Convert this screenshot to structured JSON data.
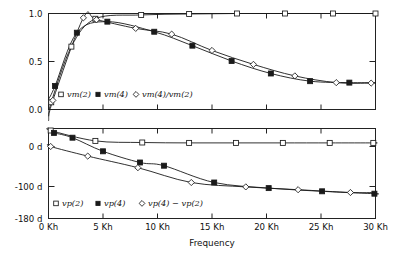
{
  "figure": {
    "xlabel": "Frequency",
    "background": "#ffffff",
    "line_color": "#1a1a1a"
  },
  "chart_data": [
    {
      "type": "line",
      "panel": "top",
      "title": "",
      "xlabel": "Frequency",
      "ylabel": "",
      "xlim": [
        0,
        30
      ],
      "ylim": [
        0.0,
        1.0
      ],
      "xticks": [
        0,
        5,
        10,
        15,
        20,
        25,
        30
      ],
      "xticklabels": [
        "0 Kh",
        "5 Kh",
        "10 Kh",
        "15 Kh",
        "20 Kh",
        "25 Kh",
        "30 Kh"
      ],
      "yticks": [
        0.0,
        0.5,
        1.0
      ],
      "yticklabels": [
        "0.0",
        "0.5",
        "1.0"
      ],
      "grid": false,
      "legend_position": "lower-left-inside",
      "series": [
        {
          "name": "vm(2)",
          "marker": "open-square",
          "x": [
            0.25,
            2.1,
            4.3,
            8.5,
            12.9,
            17.3,
            21.7,
            26.1,
            30.0
          ],
          "y": [
            0.075,
            0.655,
            0.945,
            0.985,
            0.995,
            1.0,
            1.0,
            1.0,
            1.0
          ]
        },
        {
          "name": "vm(4)",
          "marker": "filled-square",
          "x": [
            0.6,
            2.6,
            5.4,
            9.7,
            13.2,
            16.8,
            20.4,
            24.0,
            27.6
          ],
          "y": [
            0.245,
            0.8,
            0.915,
            0.81,
            0.665,
            0.505,
            0.375,
            0.295,
            0.28
          ]
        },
        {
          "name": "vm(4)/vm(2)",
          "marker": "open-diamond",
          "x": [
            0.4,
            3.2,
            4.4,
            8.0,
            11.3,
            15.0,
            18.8,
            22.6,
            26.4,
            29.6
          ],
          "y": [
            0.095,
            0.955,
            0.935,
            0.845,
            0.785,
            0.615,
            0.47,
            0.35,
            0.28,
            0.275
          ]
        }
      ]
    },
    {
      "type": "line",
      "panel": "bottom",
      "title": "",
      "xlabel": "Frequency",
      "ylabel": "",
      "xlim": [
        0,
        30
      ],
      "ylim": [
        -180,
        45
      ],
      "xticks": [
        0,
        5,
        10,
        15,
        20,
        25,
        30
      ],
      "xticklabels": [
        "0 Kh",
        "5 Kh",
        "10 Kh",
        "15 Kh",
        "20 Kh",
        "25 Kh",
        "30 Kh"
      ],
      "yticks": [
        0,
        -100,
        -180
      ],
      "yticklabels": [
        "0 d",
        "-100 d",
        "-180 d"
      ],
      "grid": false,
      "legend_position": "lower-left-inside",
      "series": [
        {
          "name": "vp(2)",
          "marker": "open-square",
          "x": [
            0.2,
            4.3,
            8.6,
            12.9,
            17.2,
            21.5,
            25.8,
            29.8
          ],
          "y": [
            40,
            14,
            10,
            9,
            9,
            9,
            9,
            9
          ]
        },
        {
          "name": "vp(4)",
          "marker": "filled-square",
          "x": [
            0.5,
            2.2,
            5.0,
            8.4,
            10.6,
            15.2,
            20.2,
            25.1,
            29.9
          ],
          "y": [
            34,
            22,
            -12,
            -40,
            -48,
            -90,
            -104,
            -112,
            -118
          ]
        },
        {
          "name": "vp(4) − vp(2)",
          "marker": "open-diamond",
          "x": [
            0.2,
            3.6,
            8.2,
            13.1,
            18.1,
            22.9,
            27.7
          ],
          "y": [
            0,
            -24,
            -53,
            -90,
            -101,
            -108,
            -115
          ]
        }
      ]
    }
  ],
  "top_panel": {
    "yticklabels": [
      "1.0",
      "0.5",
      "0.0"
    ],
    "legend": [
      {
        "marker": "open-square",
        "label": "vm(2)"
      },
      {
        "marker": "filled-square",
        "label": "vm(4)"
      },
      {
        "marker": "open-diamond",
        "label": "vm(4)/vm(2)"
      }
    ]
  },
  "bottom_panel": {
    "yticklabels": [
      "0 d",
      "-100 d",
      "-180 d"
    ],
    "legend": [
      {
        "marker": "open-square",
        "label": "vp(2)"
      },
      {
        "marker": "filled-square",
        "label": "vp(4)"
      },
      {
        "marker": "open-diamond",
        "label": "vp(4) − vp(2)"
      }
    ]
  },
  "xaxis": {
    "label": "Frequency",
    "ticklabels": [
      "0 Kh",
      "5 Kh",
      "10 Kh",
      "15 Kh",
      "20 Kh",
      "25 Kh",
      "30 Kh"
    ]
  }
}
